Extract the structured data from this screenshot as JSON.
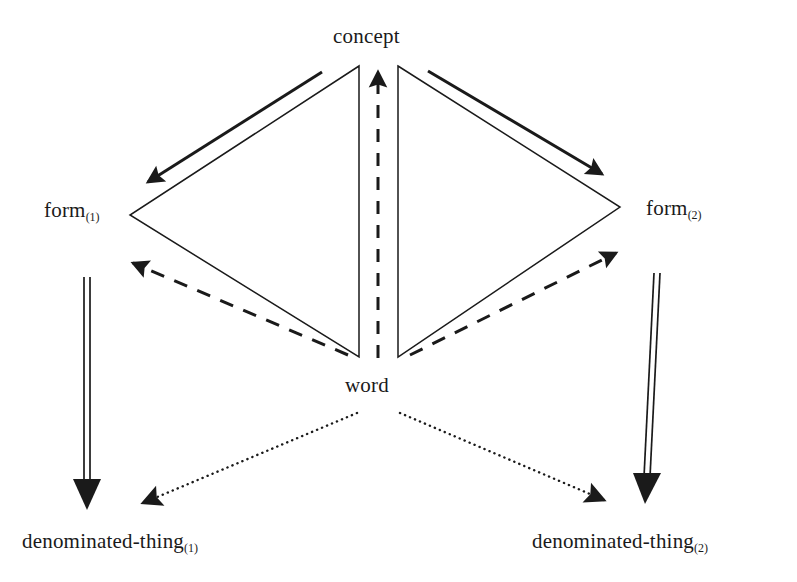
{
  "diagram": {
    "background_color": "#ffffff",
    "stroke_color": "#1a1a1a",
    "nodes": [
      {
        "id": "concept",
        "label": "concept",
        "subscript": "",
        "x": 378,
        "y": 38
      },
      {
        "id": "form1",
        "label": "form",
        "subscript": "(1)",
        "x": 80,
        "y": 213
      },
      {
        "id": "form2",
        "label": "form",
        "subscript": "(2)",
        "x": 680,
        "y": 212
      },
      {
        "id": "word",
        "label": "word",
        "subscript": "",
        "x": 378,
        "y": 388
      },
      {
        "id": "dt1",
        "label": "denominated-thing",
        "subscript": "(1)",
        "x": 150,
        "y": 545
      },
      {
        "id": "dt2",
        "label": "denominated-thing",
        "subscript": "(2)",
        "x": 660,
        "y": 545
      }
    ],
    "edges": [
      {
        "id": "concept-to-form1",
        "from": "concept",
        "to": "form1",
        "style": "solid-thick",
        "arrow": "end"
      },
      {
        "id": "concept-to-form2",
        "from": "concept",
        "to": "form2",
        "style": "solid-thick",
        "arrow": "end"
      },
      {
        "id": "triangle-left",
        "from": "concept",
        "to": "word",
        "style": "solid-thin",
        "arrow": "none"
      },
      {
        "id": "triangle-right",
        "from": "concept",
        "to": "word",
        "style": "solid-thin",
        "arrow": "none"
      },
      {
        "id": "word-to-concept",
        "from": "word",
        "to": "concept",
        "style": "dashed",
        "arrow": "end"
      },
      {
        "id": "word-to-form1",
        "from": "word",
        "to": "form1",
        "style": "dashed",
        "arrow": "end"
      },
      {
        "id": "word-to-form2",
        "from": "word",
        "to": "form2",
        "style": "dashed",
        "arrow": "end"
      },
      {
        "id": "form1-to-dt1",
        "from": "form1",
        "to": "dt1",
        "style": "double-line",
        "arrow": "end"
      },
      {
        "id": "form2-to-dt2",
        "from": "form2",
        "to": "dt2",
        "style": "double-line",
        "arrow": "end"
      },
      {
        "id": "word-to-dt1",
        "from": "word",
        "to": "dt1",
        "style": "dotted",
        "arrow": "end"
      },
      {
        "id": "word-to-dt2",
        "from": "word",
        "to": "dt2",
        "style": "dotted",
        "arrow": "end"
      }
    ]
  }
}
